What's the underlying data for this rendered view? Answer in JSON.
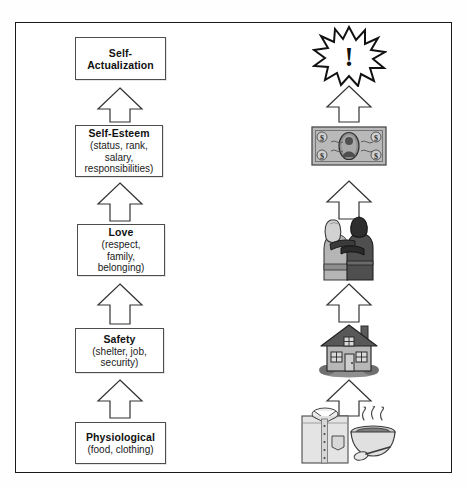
{
  "diagram": {
    "type": "hierarchy-ladder",
    "orientation": "bottom-to-top",
    "frame_color": "#1a1a1a",
    "box_border_color": "#4d4d4d",
    "arrow_outline_color": "#333333",
    "levels": [
      {
        "index": 5,
        "title": "Self-Actualization",
        "title_lines": [
          "Self-",
          "Actualization"
        ],
        "subtitle": "",
        "subtitle_lines": [],
        "icon_name": "starburst-exclamation-icon",
        "icon_label": "!"
      },
      {
        "index": 4,
        "title": "Self-Esteem",
        "title_lines": [
          "Self-Esteem"
        ],
        "subtitle": "(status, rank, salary, responsibilities)",
        "subtitle_lines": [
          "(status, rank,",
          "salary,",
          "responsibilities)"
        ],
        "icon_name": "dollar-bill-icon",
        "icon_label": "$"
      },
      {
        "index": 3,
        "title": "Love",
        "title_lines": [
          "Love"
        ],
        "subtitle": "(respect, family, belonging)",
        "subtitle_lines": [
          "(respect,",
          "family,",
          "belonging)"
        ],
        "icon_name": "embracing-couple-icon",
        "icon_label": ""
      },
      {
        "index": 2,
        "title": "Safety",
        "title_lines": [
          "Safety"
        ],
        "subtitle": "(shelter, job, security)",
        "subtitle_lines": [
          "(shelter, job,",
          "security)"
        ],
        "icon_name": "house-icon",
        "icon_label": ""
      },
      {
        "index": 1,
        "title": "Physiological",
        "title_lines": [
          "Physiological"
        ],
        "subtitle": "(food, clothing)",
        "subtitle_lines": [
          "(food, clothing)"
        ],
        "icon_name": "shirt-and-soup-bowl-icon",
        "icon_label": ""
      }
    ],
    "arrows": {
      "count_left": 4,
      "count_right": 4,
      "style": "hollow-outline-up-arrow",
      "direction": "up"
    }
  }
}
